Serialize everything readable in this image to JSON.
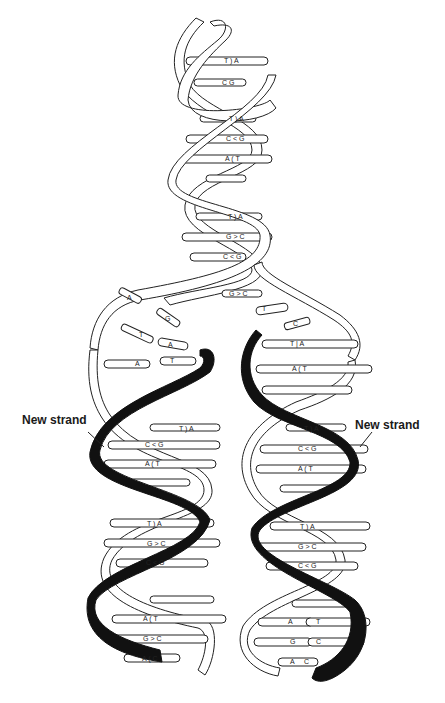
{
  "labels": {
    "new_strand_left": "New strand",
    "new_strand_right": "New strand"
  },
  "colors": {
    "new_strand": "#111111",
    "old_strand": "#ffffff",
    "outline": "#222222"
  },
  "parent_helix": {
    "base_pairs": [
      {
        "left": "T",
        "right": "A",
        "y": 62
      },
      {
        "left": "C",
        "right": "G",
        "y": 83
      },
      {
        "left": "T",
        "right": "A",
        "y": 120
      },
      {
        "left": "C",
        "right": "G",
        "y": 140
      },
      {
        "left": "A",
        "right": "T",
        "y": 160
      },
      {
        "left": "T",
        "right": "A",
        "y": 218
      },
      {
        "left": "G",
        "right": "C",
        "y": 238
      },
      {
        "left": "C",
        "right": "G",
        "y": 258
      },
      {
        "left": "G",
        "right": "C",
        "y": 295
      }
    ]
  },
  "fork": {
    "loose_bases": [
      {
        "base": "A",
        "x": 130,
        "y": 298
      },
      {
        "base": "G",
        "x": 168,
        "y": 320
      },
      {
        "base": "T",
        "x": 142,
        "y": 337
      },
      {
        "base": "A",
        "x": 170,
        "y": 345
      },
      {
        "base": "A",
        "x": 137,
        "y": 365
      },
      {
        "base": "T",
        "x": 172,
        "y": 362
      },
      {
        "base": "T",
        "x": 265,
        "y": 309
      },
      {
        "base": "C",
        "x": 295,
        "y": 324
      }
    ]
  },
  "left_daughter": {
    "base_pairs": [
      {
        "left": "T",
        "right": "A",
        "y": 430
      },
      {
        "left": "C",
        "right": "G",
        "y": 446
      },
      {
        "left": "A",
        "right": "T",
        "y": 465
      },
      {
        "left": "T",
        "right": "A",
        "y": 525
      },
      {
        "left": "G",
        "right": "C",
        "y": 545
      },
      {
        "left": "C",
        "right": "G",
        "y": 564
      },
      {
        "left": "A",
        "right": "T",
        "y": 620
      },
      {
        "left": "G",
        "right": "C",
        "y": 640
      },
      {
        "left": "A",
        "right": "C",
        "y": 660
      }
    ]
  },
  "right_daughter": {
    "base_pairs": [
      {
        "left": "T",
        "right": "A",
        "y": 345
      },
      {
        "left": "A",
        "right": "T",
        "y": 370
      },
      {
        "left": "T",
        "right": "A",
        "y": 430
      },
      {
        "left": "C",
        "right": "G",
        "y": 450
      },
      {
        "left": "A",
        "right": "T",
        "y": 470
      },
      {
        "left": "T",
        "right": "A",
        "y": 528
      },
      {
        "left": "G",
        "right": "C",
        "y": 548
      },
      {
        "left": "C",
        "right": "G",
        "y": 567
      },
      {
        "left": "A",
        "right": "T",
        "y": 623
      },
      {
        "left": "G",
        "right": "C",
        "y": 643
      },
      {
        "left": "A",
        "right": "C",
        "y": 663
      }
    ]
  }
}
